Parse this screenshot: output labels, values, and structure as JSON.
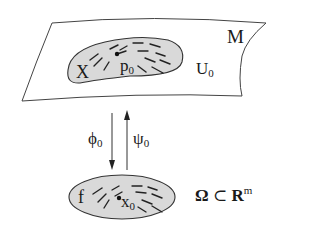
{
  "diagram": {
    "manifold": {
      "label": "M"
    },
    "chart_domain": {
      "label": "U",
      "subscript": "0"
    },
    "vector_field_manifold": {
      "label": "X"
    },
    "point_manifold": {
      "label": "p",
      "subscript": "0"
    },
    "map_down": {
      "label": "ϕ",
      "subscript": "0"
    },
    "map_up": {
      "label": "ψ",
      "subscript": "0"
    },
    "vector_field_local": {
      "label": "f"
    },
    "point_local": {
      "label": "x",
      "subscript": "0"
    },
    "local_domain": {
      "omega": "Ω",
      "subset": "⊂",
      "R": "R",
      "exponent": "m"
    },
    "colors": {
      "fill": "#d9d9d9",
      "stroke": "#333333",
      "background": "#ffffff"
    }
  }
}
